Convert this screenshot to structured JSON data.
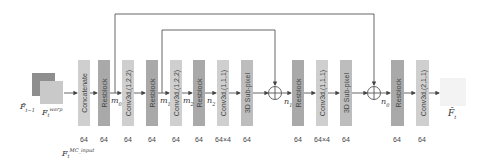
{
  "diagram": {
    "inputs": {
      "prev_frame_label": "F̂",
      "prev_frame_sub": "t−1",
      "warp_frame_label": "F",
      "warp_frame_sub": "t",
      "warp_frame_sup": "warp",
      "mc_input_label": "F",
      "mc_input_sub": "t",
      "mc_input_sup": "MC_input"
    },
    "blocks": [
      {
        "id": "concat",
        "label": "Concatenate",
        "channels": "64",
        "shade": "light",
        "x": 78
      },
      {
        "id": "res1",
        "label": "Resblock",
        "channels": "64",
        "shade": "dark",
        "x": 98
      },
      {
        "id": "conv1",
        "label": "Conv3d,(1,2,2)",
        "channels": "64",
        "shade": "light",
        "x": 122
      },
      {
        "id": "res2",
        "label": "Resblock",
        "channels": "64",
        "shade": "dark",
        "x": 146
      },
      {
        "id": "conv2",
        "label": "Conv3d,(1,2,2)",
        "channels": "64",
        "shade": "light",
        "x": 170
      },
      {
        "id": "res3",
        "label": "Resblock",
        "channels": "64",
        "shade": "dark",
        "x": 193
      },
      {
        "id": "conv3",
        "label": "Conv3d,(1,1,1)",
        "channels": "64×4",
        "shade": "light",
        "x": 217
      },
      {
        "id": "sub1",
        "label": "3D Sub-pixel",
        "channels": "64",
        "shade": "mid",
        "x": 241
      },
      {
        "id": "res4",
        "label": "Resblock",
        "channels": "64",
        "shade": "dark",
        "x": 292
      },
      {
        "id": "conv4",
        "label": "Conv3d,(1,1,1)",
        "channels": "64×4",
        "shade": "light",
        "x": 316
      },
      {
        "id": "sub2",
        "label": "3D Sub-pixel",
        "channels": "64",
        "shade": "mid",
        "x": 340
      },
      {
        "id": "res5",
        "label": "Resblock",
        "channels": "64",
        "shade": "dark",
        "x": 391
      },
      {
        "id": "conv5",
        "label": "Conv3d,(2,1,1)",
        "channels": "64",
        "shade": "light",
        "x": 416
      }
    ],
    "feature_labels": {
      "m0": {
        "base": "m",
        "sub": "0"
      },
      "m1": {
        "base": "m",
        "sub": "1"
      },
      "m2": {
        "base": "m",
        "sub": "2"
      },
      "n2": {
        "base": "n",
        "sub": "2"
      },
      "n1": {
        "base": "n",
        "sub": "1"
      },
      "n0": {
        "base": "n",
        "sub": "0"
      }
    },
    "output": {
      "label": "F̂",
      "sub": "t"
    },
    "add_symbol": "⊕"
  }
}
